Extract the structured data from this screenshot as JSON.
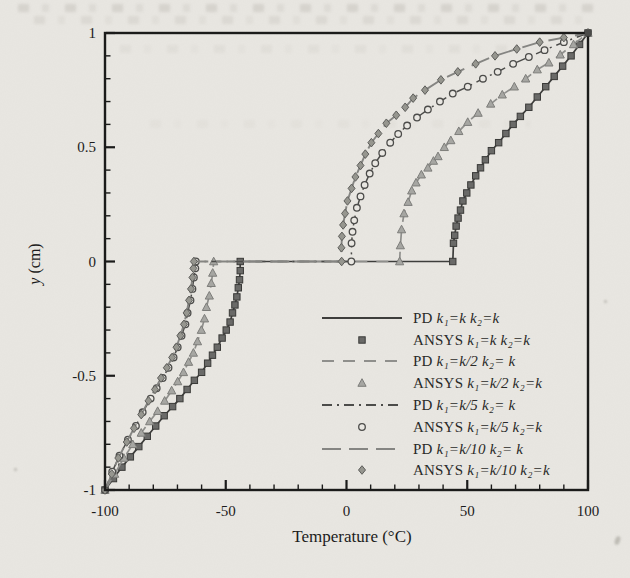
{
  "page": {
    "kind": "scanned journal figure",
    "paper_color": "#e9e7e2",
    "ink_color": "#1c1c1c"
  },
  "figure": {
    "x_label": "Temperature (°C)",
    "y_label_var": "y",
    "y_label_rest": " (cm)",
    "x_tick_labels": [
      "-100",
      "-50",
      "0",
      "50",
      "100"
    ],
    "y_tick_labels": [
      "-1",
      "-0.5",
      "0",
      "0.5",
      "1"
    ]
  },
  "legend": {
    "entries": [
      {
        "method": "PD",
        "params": "k₁=k  k₂=k",
        "symbol": "solid-line"
      },
      {
        "method": "ANSYS",
        "params": "k₁=k  k₂=k",
        "symbol": "square-marker"
      },
      {
        "method": "PD",
        "params": "k₁=k/2  k₂= k",
        "symbol": "dashed-line"
      },
      {
        "method": "ANSYS",
        "params": "k₁=k/2  k₂=k",
        "symbol": "triangle-marker"
      },
      {
        "method": "PD",
        "params": "k₁=k/5  k₂= k",
        "symbol": "dash-dot-line"
      },
      {
        "method": "ANSYS",
        "params": "k₁=k/5  k₂=k",
        "symbol": "circle-marker"
      },
      {
        "method": "PD",
        "params": "k₁=k/10  k₂= k",
        "symbol": "long-dash-line"
      },
      {
        "method": "ANSYS",
        "params": "k₁=k/10 k₂=k",
        "symbol": "diamond-marker"
      }
    ],
    "rows_y": [
      318,
      340,
      361,
      383,
      405,
      427,
      449,
      470
    ],
    "sample_x1": 322,
    "sample_x2": 402,
    "marker_x": 362,
    "text_x": 413
  },
  "chart_data": {
    "type": "line",
    "title": "",
    "xlabel": "Temperature (°C)",
    "ylabel": "y (cm)",
    "xlim": [
      -100,
      100
    ],
    "ylim": [
      -1,
      1
    ],
    "x_major_ticks": [
      -100,
      -50,
      0,
      50,
      100
    ],
    "x_minor_step": 10,
    "y_major_ticks": [
      -1,
      -0.5,
      0,
      0.5,
      1
    ],
    "y_minor_step": 0.1,
    "grid": false,
    "legend_position": "lower right",
    "note": "Each pair = PD line + ANSYS markers lying on the same temperature profile; profiles jump across the interface y=0. Points are [temperature_C, y_cm].",
    "pairs": [
      {
        "pd_name": "PD k1=k k2=k",
        "ansys_name": "ANSYS k1=k k2=k",
        "line_style": "solid",
        "line_color": "#3e3e3c",
        "line_width": 1.7,
        "dash": "",
        "marker": "square",
        "marker_fill": "#6a6a68",
        "marker_stroke": "#3a3a38",
        "interface_temps": [
          -44,
          44
        ],
        "bottom": [
          [
            -100,
            -1
          ],
          [
            -96.5,
            -0.95
          ],
          [
            -93,
            -0.9
          ],
          [
            -89.5,
            -0.855
          ],
          [
            -86,
            -0.81
          ],
          [
            -82.5,
            -0.765
          ],
          [
            -79,
            -0.72
          ],
          [
            -75.5,
            -0.675
          ],
          [
            -72,
            -0.635
          ],
          [
            -69,
            -0.6
          ],
          [
            -66,
            -0.56
          ],
          [
            -63,
            -0.52
          ],
          [
            -60,
            -0.485
          ],
          [
            -57.5,
            -0.445
          ],
          [
            -55.5,
            -0.41
          ],
          [
            -53.5,
            -0.375
          ],
          [
            -51.5,
            -0.335
          ],
          [
            -49.8,
            -0.3
          ],
          [
            -48.2,
            -0.265
          ],
          [
            -47.2,
            -0.225
          ],
          [
            -46.2,
            -0.19
          ],
          [
            -45.4,
            -0.155
          ],
          [
            -44.8,
            -0.115
          ],
          [
            -44.3,
            -0.08
          ],
          [
            -44,
            -0.04
          ],
          [
            -44,
            0
          ]
        ],
        "top": [
          [
            44,
            0
          ],
          [
            44.3,
            0.08
          ],
          [
            44.8,
            0.115
          ],
          [
            45.4,
            0.155
          ],
          [
            46.2,
            0.19
          ],
          [
            47.2,
            0.225
          ],
          [
            48.2,
            0.265
          ],
          [
            49.8,
            0.3
          ],
          [
            51.5,
            0.335
          ],
          [
            53.5,
            0.375
          ],
          [
            55.5,
            0.41
          ],
          [
            57.5,
            0.445
          ],
          [
            60,
            0.485
          ],
          [
            63,
            0.52
          ],
          [
            66,
            0.56
          ],
          [
            69,
            0.6
          ],
          [
            72,
            0.635
          ],
          [
            75.5,
            0.675
          ],
          [
            79,
            0.72
          ],
          [
            82.5,
            0.765
          ],
          [
            86,
            0.81
          ],
          [
            89.5,
            0.855
          ],
          [
            93,
            0.9
          ],
          [
            96.5,
            0.95
          ],
          [
            100,
            1
          ]
        ]
      },
      {
        "pd_name": "PD k1=k/2 k2=k",
        "ansys_name": "ANSYS k1=k/2 k2=k",
        "line_style": "dashed",
        "line_color": "#8f8f8c",
        "line_width": 1.7,
        "dash": "12,9",
        "marker": "triangle",
        "marker_fill": "#a6a6a2",
        "marker_stroke": "#7d7d7a",
        "interface_temps": [
          -55,
          22
        ],
        "bottom": [
          [
            -100,
            -1
          ],
          [
            -96,
            -0.93
          ],
          [
            -92.2,
            -0.86
          ],
          [
            -88.5,
            -0.8
          ],
          [
            -85,
            -0.75
          ],
          [
            -81.5,
            -0.7
          ],
          [
            -78.2,
            -0.655
          ],
          [
            -75.3,
            -0.61
          ],
          [
            -72.4,
            -0.565
          ],
          [
            -69.9,
            -0.525
          ],
          [
            -67.5,
            -0.485
          ],
          [
            -65.4,
            -0.44
          ],
          [
            -63.4,
            -0.4
          ],
          [
            -61.7,
            -0.35
          ],
          [
            -60.1,
            -0.3
          ],
          [
            -58.8,
            -0.25
          ],
          [
            -58,
            -0.2
          ],
          [
            -56.8,
            -0.15
          ],
          [
            -56,
            -0.095
          ],
          [
            -55.4,
            -0.05
          ],
          [
            -55,
            0
          ]
        ],
        "top": [
          [
            22,
            0
          ],
          [
            22.3,
            0.07
          ],
          [
            22.8,
            0.14
          ],
          [
            23.8,
            0.21
          ],
          [
            25.5,
            0.26
          ],
          [
            27,
            0.31
          ],
          [
            28.8,
            0.345
          ],
          [
            31,
            0.38
          ],
          [
            33.7,
            0.41
          ],
          [
            36,
            0.44
          ],
          [
            37.9,
            0.46
          ],
          [
            40.5,
            0.5
          ],
          [
            43.2,
            0.53
          ],
          [
            46.5,
            0.57
          ],
          [
            50.2,
            0.61
          ],
          [
            54.5,
            0.65
          ],
          [
            59.7,
            0.69
          ],
          [
            64.5,
            0.73
          ],
          [
            69.5,
            0.765
          ],
          [
            74.2,
            0.8
          ],
          [
            79,
            0.84
          ],
          [
            83.8,
            0.87
          ],
          [
            88.5,
            0.905
          ],
          [
            94,
            0.95
          ],
          [
            100,
            1
          ]
        ]
      },
      {
        "pd_name": "PD k1=k/5 k2=k",
        "ansys_name": "ANSYS k1=k/5 k2=k",
        "line_style": "dash-dot",
        "line_color": "#4c4c4a",
        "line_width": 1.5,
        "dash": "10,5,2,5",
        "marker": "circle",
        "marker_fill": "#e9e7e2",
        "marker_stroke": "#4c4c4a",
        "interface_temps": [
          -62.4,
          2
        ],
        "bottom": [
          [
            -100,
            -1
          ],
          [
            -97,
            -0.92
          ],
          [
            -94,
            -0.85
          ],
          [
            -90.5,
            -0.78
          ],
          [
            -87.2,
            -0.72
          ],
          [
            -84.4,
            -0.66
          ],
          [
            -81.1,
            -0.6
          ],
          [
            -78.6,
            -0.555
          ],
          [
            -76.1,
            -0.51
          ],
          [
            -73.7,
            -0.465
          ],
          [
            -71.6,
            -0.42
          ],
          [
            -69.9,
            -0.375
          ],
          [
            -68.3,
            -0.325
          ],
          [
            -66.7,
            -0.275
          ],
          [
            -65.8,
            -0.225
          ],
          [
            -64.6,
            -0.17
          ],
          [
            -63.8,
            -0.12
          ],
          [
            -63.2,
            -0.07
          ],
          [
            -62.6,
            -0.03
          ],
          [
            -62.4,
            0
          ]
        ],
        "top": [
          [
            2,
            0
          ],
          [
            2.1,
            0.08
          ],
          [
            2.5,
            0.13
          ],
          [
            3.2,
            0.18
          ],
          [
            4.3,
            0.235
          ],
          [
            5.8,
            0.285
          ],
          [
            7.5,
            0.335
          ],
          [
            9.6,
            0.385
          ],
          [
            11.9,
            0.43
          ],
          [
            14.8,
            0.475
          ],
          [
            18.1,
            0.52
          ],
          [
            21.4,
            0.558
          ],
          [
            25.1,
            0.595
          ],
          [
            29.2,
            0.63
          ],
          [
            33.7,
            0.665
          ],
          [
            38.7,
            0.7
          ],
          [
            44,
            0.735
          ],
          [
            50.2,
            0.765
          ],
          [
            56.5,
            0.8
          ],
          [
            62.6,
            0.83
          ],
          [
            69,
            0.865
          ],
          [
            75.5,
            0.895
          ],
          [
            82,
            0.925
          ],
          [
            90,
            0.96
          ],
          [
            100,
            1
          ]
        ]
      },
      {
        "pd_name": "PD k1=k/10 k2=k",
        "ansys_name": "ANSYS k1=k/10 k2=k",
        "line_style": "long-dash",
        "line_color": "#858582",
        "line_width": 1.9,
        "dash": "19,8",
        "marker": "diamond",
        "marker_fill": "#96968f",
        "marker_stroke": "#5e5e5b",
        "interface_temps": [
          -63.2,
          -2
        ],
        "bottom": [
          [
            -100,
            -1
          ],
          [
            -97.2,
            -0.93
          ],
          [
            -94.5,
            -0.86
          ],
          [
            -91,
            -0.79
          ],
          [
            -88,
            -0.73
          ],
          [
            -85,
            -0.67
          ],
          [
            -82,
            -0.61
          ],
          [
            -79.3,
            -0.56
          ],
          [
            -76.8,
            -0.51
          ],
          [
            -74.4,
            -0.465
          ],
          [
            -72.2,
            -0.42
          ],
          [
            -70.4,
            -0.375
          ],
          [
            -68.8,
            -0.325
          ],
          [
            -67.3,
            -0.275
          ],
          [
            -66.2,
            -0.225
          ],
          [
            -65.2,
            -0.17
          ],
          [
            -64.4,
            -0.12
          ],
          [
            -63.8,
            -0.07
          ],
          [
            -63.4,
            -0.03
          ],
          [
            -63.2,
            0
          ]
        ],
        "top": [
          [
            -2,
            0
          ],
          [
            -2.1,
            0.06
          ],
          [
            -1.9,
            0.11
          ],
          [
            -1.4,
            0.16
          ],
          [
            -0.6,
            0.21
          ],
          [
            0.4,
            0.265
          ],
          [
            2.1,
            0.32
          ],
          [
            3.7,
            0.37
          ],
          [
            5.8,
            0.42
          ],
          [
            7.8,
            0.47
          ],
          [
            10.3,
            0.52
          ],
          [
            13.2,
            0.56
          ],
          [
            16.5,
            0.605
          ],
          [
            20.6,
            0.64
          ],
          [
            24.3,
            0.675
          ],
          [
            27.6,
            0.715
          ],
          [
            32.5,
            0.75
          ],
          [
            39.1,
            0.795
          ],
          [
            46.1,
            0.83
          ],
          [
            53.5,
            0.865
          ],
          [
            61.5,
            0.9
          ],
          [
            70.5,
            0.93
          ],
          [
            80,
            0.96
          ],
          [
            90,
            0.98
          ],
          [
            100,
            1
          ]
        ]
      }
    ],
    "plot_box_px": {
      "left": 105,
      "right": 588,
      "top": 33,
      "bottom": 490
    }
  }
}
